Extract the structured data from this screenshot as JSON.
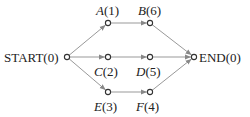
{
  "diagram": {
    "type": "activity-network",
    "nodes": [
      {
        "id": "start",
        "name": "START",
        "label": "START(0)",
        "x": 67,
        "y": 57
      },
      {
        "id": "a",
        "name": "A",
        "label": "(1)",
        "x": 108,
        "y": 23
      },
      {
        "id": "b",
        "name": "B",
        "label": "(6)",
        "x": 150,
        "y": 23
      },
      {
        "id": "c",
        "name": "C",
        "label": "(2)",
        "x": 108,
        "y": 57
      },
      {
        "id": "d",
        "name": "D",
        "label": "(5)",
        "x": 150,
        "y": 57
      },
      {
        "id": "e",
        "name": "E",
        "label": "(3)",
        "x": 108,
        "y": 92
      },
      {
        "id": "f",
        "name": "F",
        "label": "(4)",
        "x": 150,
        "y": 92
      },
      {
        "id": "end",
        "name": "END",
        "label": "END(0)",
        "x": 194,
        "y": 57
      }
    ],
    "edges": [
      [
        "start",
        "a"
      ],
      [
        "start",
        "c"
      ],
      [
        "start",
        "e"
      ],
      [
        "a",
        "b"
      ],
      [
        "c",
        "d"
      ],
      [
        "e",
        "f"
      ],
      [
        "b",
        "end"
      ],
      [
        "d",
        "end"
      ],
      [
        "f",
        "end"
      ]
    ],
    "colors": {
      "edge": "#999999",
      "node": "#333333",
      "text": "#222222"
    }
  }
}
